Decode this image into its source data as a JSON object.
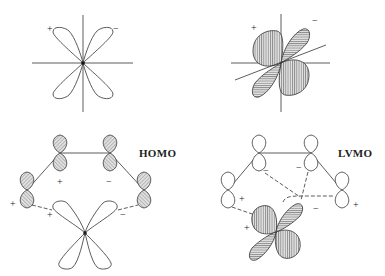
{
  "panels": [
    {
      "id": "metal-d-orbital",
      "signs": [
        "+",
        "−"
      ]
    },
    {
      "id": "metal-d-orbital-hybridized",
      "signs": [
        "+",
        "−"
      ]
    },
    {
      "id": "homo-interaction",
      "title": "HOMO",
      "signs": [
        "+",
        "−",
        "+",
        "+",
        "−"
      ]
    },
    {
      "id": "lvmo-interaction",
      "title": "LVMO",
      "signs": [
        "−",
        "−",
        "+",
        "+",
        "−",
        "+"
      ]
    }
  ],
  "colors": {
    "line": "#333333",
    "fill": "#d8d8d8",
    "background": "#ffffff"
  }
}
